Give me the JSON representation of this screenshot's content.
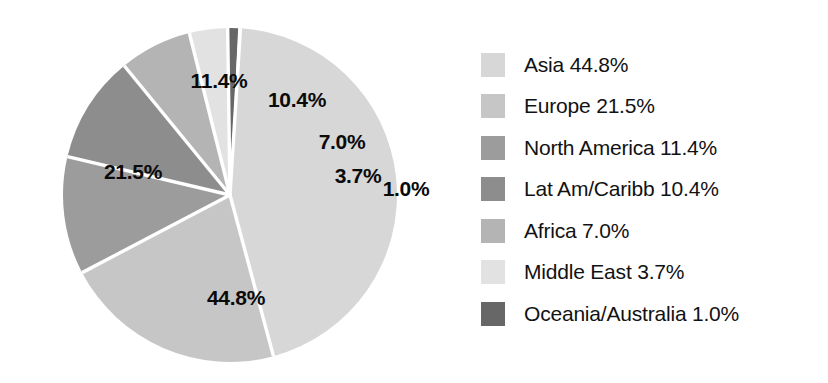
{
  "chart_data": {
    "type": "pie",
    "title": "",
    "subtitle": "",
    "xlabel": "",
    "ylabel": "",
    "legend_position": "right",
    "grid": false,
    "units": "percent",
    "categories": [
      "Asia",
      "Europe",
      "North America",
      "Lat Am/Caribb",
      "Africa",
      "Middle East",
      "Oceania/Australia"
    ],
    "values": [
      44.8,
      21.5,
      11.4,
      10.4,
      7.0,
      3.7,
      1.0
    ],
    "colors": [
      "#d7d7d7",
      "#c6c6c6",
      "#9c9c9c",
      "#8d8d8d",
      "#b4b4b4",
      "#e2e2e2",
      "#676767"
    ],
    "slices": [
      {
        "name": "Asia",
        "value": 44.8,
        "label": "44.8%",
        "color": "#d7d7d7",
        "start_angle": 3.6,
        "end_angle": 164.9,
        "label_x": 236,
        "label_y": 298
      },
      {
        "name": "Europe",
        "value": 21.5,
        "label": "21.5%",
        "color": "#c6c6c6",
        "start_angle": 164.9,
        "end_angle": 242.3,
        "label_x": 133,
        "label_y": 172
      },
      {
        "name": "North America",
        "value": 11.4,
        "label": "11.4%",
        "color": "#9c9c9c",
        "start_angle": 242.3,
        "end_angle": 283.3,
        "label_x": 219,
        "label_y": 81
      },
      {
        "name": "Lat Am/Caribb",
        "value": 10.4,
        "label": "10.4%",
        "color": "#8d8d8d",
        "start_angle": 283.3,
        "end_angle": 320.7,
        "label_x": 297,
        "label_y": 100
      },
      {
        "name": "Africa",
        "value": 7.0,
        "label": "7.0%",
        "color": "#b4b4b4",
        "start_angle": 320.7,
        "end_angle": 345.9,
        "label_x": 342,
        "label_y": 142
      },
      {
        "name": "Middle East",
        "value": 3.7,
        "label": "3.7%",
        "color": "#e2e2e2",
        "start_angle": 345.9,
        "end_angle": 359.2,
        "label_x": 358,
        "label_y": 176
      },
      {
        "name": "Oceania/Australia",
        "value": 1.0,
        "label": "1.0%",
        "color": "#676767",
        "start_angle": 359.2,
        "end_angle": 362.8,
        "label_x": 406,
        "label_y": 189
      }
    ],
    "geometry": {
      "center_x": 230,
      "center_y": 195,
      "radius": 167,
      "separator_color": "#ffffff",
      "separator_width": 3.4
    }
  },
  "legend": {
    "items": [
      {
        "label": "Asia 44.8%",
        "color": "#d7d7d7"
      },
      {
        "label": "Europe 21.5%",
        "color": "#c6c6c6"
      },
      {
        "label": "North America 11.4%",
        "color": "#9c9c9c"
      },
      {
        "label": "Lat Am/Caribb 10.4%",
        "color": "#8d8d8d"
      },
      {
        "label": "Africa 7.0%",
        "color": "#b4b4b4"
      },
      {
        "label": "Middle East 3.7%",
        "color": "#e2e2e2"
      },
      {
        "label": "Oceania/Australia 1.0%",
        "color": "#676767"
      }
    ]
  }
}
